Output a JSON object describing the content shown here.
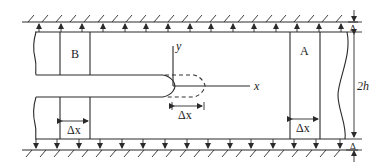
{
  "figure": {
    "labels": {
      "region_b": "B",
      "region_a": "A",
      "axis_y": "y",
      "axis_x": "x",
      "delta_x_b": "Δx",
      "delta_x_tip": "Δx",
      "delta_x_a": "Δx",
      "height": "2h",
      "delta_top": "Δ",
      "delta_bottom": "Δ"
    },
    "colors": {
      "line": "#2a2a2a",
      "background": "#ffffff"
    }
  }
}
